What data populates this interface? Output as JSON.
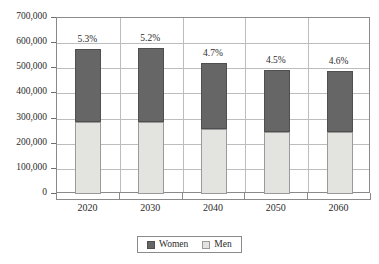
{
  "chart_data": {
    "type": "bar",
    "subtype": "stacked-vertical",
    "title": "",
    "xlabel": "",
    "ylabel": "",
    "categories": [
      "2020",
      "2030",
      "2040",
      "2050",
      "2060"
    ],
    "series": [
      {
        "name": "Men",
        "color": "#e3e3e0",
        "values": [
          285000,
          288000,
          258000,
          247000,
          246000
        ]
      },
      {
        "name": "Women",
        "color": "#666666",
        "values": [
          290000,
          292000,
          262000,
          245000,
          244000
        ]
      }
    ],
    "totals": [
      575000,
      580000,
      520000,
      492000,
      490000
    ],
    "annotations": [
      "5.3%",
      "5.2%",
      "4.7%",
      "4.5%",
      "4.6%"
    ],
    "ylim": [
      0,
      700000
    ],
    "ytick_values": [
      0,
      100000,
      200000,
      300000,
      400000,
      500000,
      600000,
      700000
    ],
    "ytick_labels": [
      "0",
      "100,000",
      "200,000",
      "300,000",
      "400,000",
      "500,000",
      "600,000",
      "700,000"
    ],
    "grid": true,
    "grid_axis": "both",
    "legend_position": "bottom-center",
    "stack_order_bottom_to_top": [
      "Men",
      "Women"
    ]
  },
  "legend": {
    "entries": [
      {
        "label": "Women",
        "swatch": "dark-gray-swatch-icon"
      },
      {
        "label": "Men",
        "swatch": "light-gray-swatch-icon"
      }
    ]
  },
  "title_remnant": " "
}
